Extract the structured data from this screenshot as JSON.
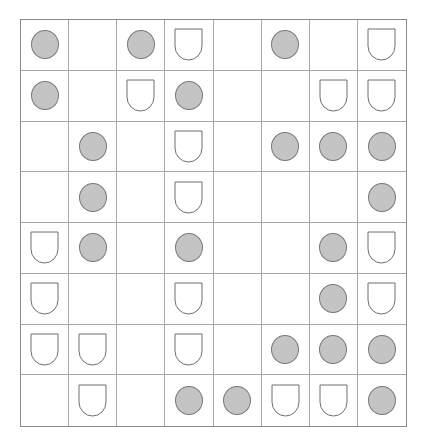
{
  "board": {
    "rows": 8,
    "cols": 8,
    "legend": {
      "C": "circle",
      "S": "shield",
      ".": "empty"
    },
    "colors": {
      "circle_fill": "#c4c4c4",
      "circle_stroke": "#7a7a7a",
      "grid_line": "#a8a8a8",
      "shield_stroke": "#6e6e6e"
    },
    "grid": [
      [
        "C",
        ".",
        "C",
        "S",
        ".",
        "C",
        ".",
        "S"
      ],
      [
        "C",
        ".",
        "S",
        "C",
        ".",
        ".",
        "S",
        "S"
      ],
      [
        ".",
        "C",
        ".",
        "S",
        ".",
        "C",
        "C",
        "C"
      ],
      [
        ".",
        "C",
        ".",
        "S",
        ".",
        ".",
        ".",
        "C"
      ],
      [
        "S",
        "C",
        ".",
        "C",
        ".",
        ".",
        "C",
        "S"
      ],
      [
        "S",
        ".",
        ".",
        "S",
        ".",
        ".",
        "C",
        "S"
      ],
      [
        "S",
        "S",
        ".",
        "S",
        ".",
        "C",
        "C",
        "C"
      ],
      [
        ".",
        "S",
        ".",
        "C",
        "C",
        "S",
        "S",
        "C"
      ]
    ]
  }
}
